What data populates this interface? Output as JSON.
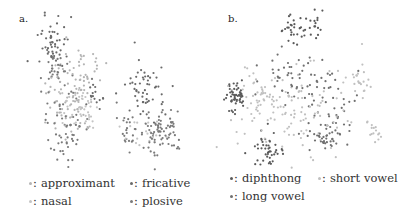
{
  "figure": {
    "panels": [
      {
        "id": "a",
        "label": "a."
      },
      {
        "id": "b",
        "label": "b."
      }
    ]
  },
  "legend_a": {
    "items": [
      {
        "label": "approximant",
        "color": "#b4b4b4"
      },
      {
        "label": "fricative",
        "color": "#6a6a6a"
      },
      {
        "label": "nasal",
        "color": "#c4c4c4"
      },
      {
        "label": "plosive",
        "color": "#7a7a7a"
      }
    ]
  },
  "legend_b": {
    "items": [
      {
        "label": "diphthong",
        "color": "#5a5a5a"
      },
      {
        "label": "short vowel",
        "color": "#c0c0c0"
      },
      {
        "label": "long vowel",
        "color": "#707070"
      }
    ]
  },
  "chart_data": [
    {
      "type": "scatter",
      "title": "a.",
      "xlabel": "",
      "ylabel": "",
      "grid": false,
      "axes_visible": false,
      "legend_position": "bottom",
      "series": [
        {
          "name": "approximant",
          "color": "#b4b4b4",
          "clusters": [
            {
              "cx": 70,
              "cy": 95,
              "sx": 12,
              "sy": 22,
              "n": 70
            },
            {
              "cx": 85,
              "cy": 70,
              "sx": 10,
              "sy": 12,
              "n": 30
            }
          ]
        },
        {
          "name": "nasal",
          "color": "#c4c4c4",
          "clusters": [
            {
              "cx": 78,
              "cy": 110,
              "sx": 10,
              "sy": 12,
              "n": 45
            },
            {
              "cx": 150,
              "cy": 135,
              "sx": 14,
              "sy": 10,
              "n": 20
            }
          ]
        },
        {
          "name": "fricative",
          "color": "#6a6a6a",
          "clusters": [
            {
              "cx": 52,
              "cy": 45,
              "sx": 7,
              "sy": 14,
              "n": 55
            },
            {
              "cx": 145,
              "cy": 90,
              "sx": 10,
              "sy": 14,
              "n": 55
            },
            {
              "cx": 95,
              "cy": 98,
              "sx": 5,
              "sy": 5,
              "n": 15
            }
          ]
        },
        {
          "name": "plosive",
          "color": "#7a7a7a",
          "clusters": [
            {
              "cx": 65,
              "cy": 125,
              "sx": 12,
              "sy": 18,
              "n": 60
            },
            {
              "cx": 160,
              "cy": 130,
              "sx": 12,
              "sy": 12,
              "n": 80
            },
            {
              "cx": 128,
              "cy": 128,
              "sx": 5,
              "sy": 10,
              "n": 20
            },
            {
              "cx": 58,
              "cy": 70,
              "sx": 6,
              "sy": 8,
              "n": 25
            }
          ]
        }
      ]
    },
    {
      "type": "scatter",
      "title": "b.",
      "xlabel": "",
      "ylabel": "",
      "grid": false,
      "axes_visible": false,
      "legend_position": "bottom",
      "series": [
        {
          "name": "diphthong",
          "color": "#5a5a5a",
          "clusters": [
            {
              "cx": 235,
              "cy": 97,
              "sx": 6,
              "sy": 8,
              "n": 55
            },
            {
              "cx": 268,
              "cy": 150,
              "sx": 8,
              "sy": 9,
              "n": 45
            },
            {
              "cx": 305,
              "cy": 28,
              "sx": 12,
              "sy": 7,
              "n": 45
            }
          ]
        },
        {
          "name": "long vowel",
          "color": "#707070",
          "clusters": [
            {
              "cx": 290,
              "cy": 72,
              "sx": 18,
              "sy": 14,
              "n": 50
            },
            {
              "cx": 330,
              "cy": 110,
              "sx": 14,
              "sy": 18,
              "n": 55
            },
            {
              "cx": 325,
              "cy": 140,
              "sx": 7,
              "sy": 6,
              "n": 25
            }
          ]
        },
        {
          "name": "short vowel",
          "color": "#c0c0c0",
          "clusters": [
            {
              "cx": 290,
              "cy": 110,
              "sx": 28,
              "sy": 22,
              "n": 110
            },
            {
              "cx": 360,
              "cy": 80,
              "sx": 7,
              "sy": 12,
              "n": 25
            },
            {
              "cx": 372,
              "cy": 132,
              "sx": 4,
              "sy": 6,
              "n": 15
            },
            {
              "cx": 258,
              "cy": 100,
              "sx": 10,
              "sy": 12,
              "n": 30
            }
          ]
        }
      ]
    }
  ]
}
